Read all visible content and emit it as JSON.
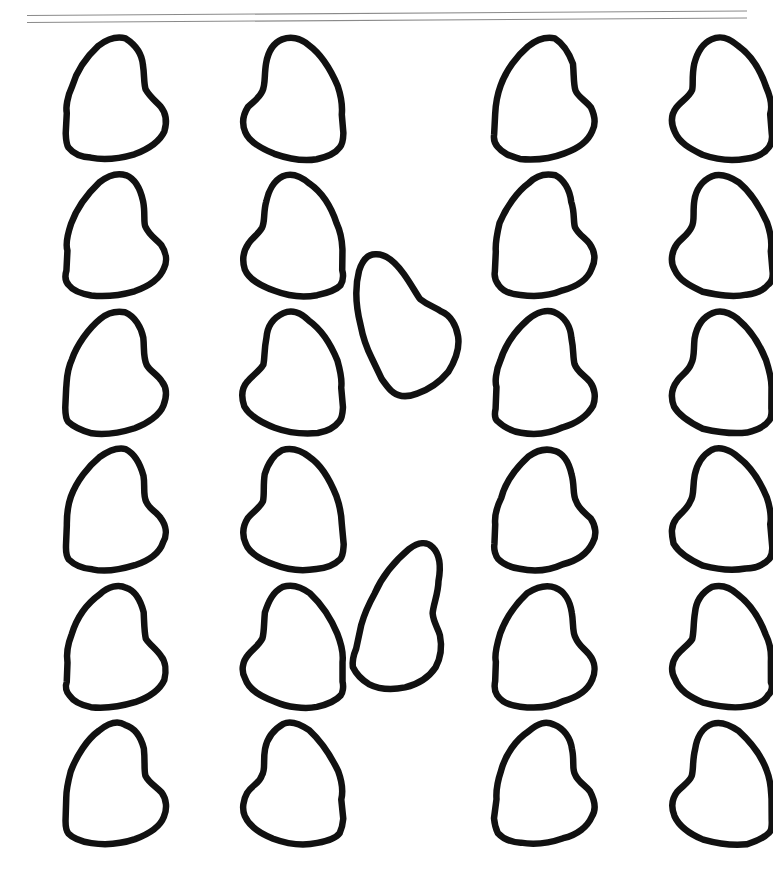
{
  "document": {
    "title": "Heart Shape Template Sheet",
    "kind": "scanned-line-art",
    "page_width": 773,
    "page_height": 877,
    "background_color": "#ffffff",
    "ink_color": "#111111",
    "rule_color": "#8a8a8a"
  },
  "rule": {
    "name": "top-double-rule",
    "stroke_width": 1.1,
    "lines": [
      {
        "x1": 27,
        "y1": 15.5,
        "x2": 747,
        "y2": 11.0
      },
      {
        "x1": 27,
        "y1": 22.5,
        "x2": 747,
        "y2": 18.0
      }
    ]
  },
  "grid": {
    "rows": 6,
    "columns_per_side": 2,
    "row_pitch": 137,
    "row_tops": [
      36,
      173,
      310,
      447,
      584,
      721
    ],
    "left_column_x": [
      14,
      184
    ],
    "right_column_x": [
      443,
      613
    ],
    "cell_width": 158,
    "cell_height": 125
  },
  "shapes": {
    "stroke_width": 6.5,
    "variant_left_label": "heart-rotated-ccw",
    "variant_right_label": "heart-rotated-cw",
    "middle_label": "heart-rotated-loose",
    "count_grid": 24,
    "count_middle": 2,
    "count_total": 26,
    "middle_hearts": [
      {
        "name": "middle-heart-upper",
        "x": 314,
        "y": 255,
        "w": 140,
        "h": 150,
        "rotate": -28
      },
      {
        "name": "middle-heart-lower",
        "x": 322,
        "y": 534,
        "w": 132,
        "h": 156,
        "rotate": 14
      }
    ],
    "path_left": "M 0.500 0.760 C 0.495 0.700 0.505 0.600 0.545 0.490 C 0.600 0.335 0.700 0.185 0.810 0.095 C 0.900 0.020 0.985 0.000 1.060 0.030 C 1.150 0.070 1.205 0.165 1.225 0.275 C 1.245 0.385 1.230 0.470 1.255 0.530 C 1.285 0.600 1.350 0.635 1.395 0.695 C 1.445 0.765 1.455 0.855 1.420 0.935 C 1.375 1.035 1.270 1.105 1.145 1.150 C 1.010 1.200 0.860 1.215 0.735 1.195 C 0.630 1.178 0.560 1.140 0.520 1.090 C 0.495 1.058 0.487 1.010 0.492 0.955 Z",
    "path_right": "M 1.500 0.760 C 1.505 0.700 1.495 0.600 1.455 0.490 C 1.400 0.335 1.300 0.185 1.190 0.095 C 1.100 0.020 1.015 0.000 0.940 0.030 C 0.850 0.070 0.795 0.165 0.775 0.275 C 0.755 0.385 0.770 0.470 0.745 0.530 C 0.715 0.600 0.650 0.635 0.605 0.695 C 0.555 0.765 0.545 0.855 0.580 0.935 C 0.625 1.035 0.730 1.105 0.855 1.150 C 0.990 1.200 1.140 1.215 1.265 1.195 C 1.370 1.178 1.440 1.140 1.480 1.090 C 1.505 1.058 1.513 1.010 1.508 0.955 Z"
  }
}
